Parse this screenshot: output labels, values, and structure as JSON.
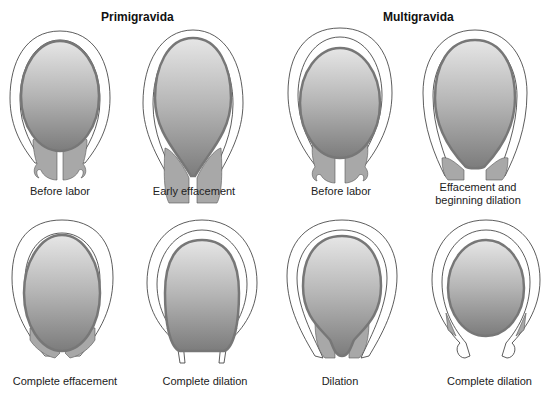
{
  "groups": [
    {
      "title": "Primigravida"
    },
    {
      "title": "Multigravida"
    }
  ],
  "panels": [
    {
      "caption": "Before labor",
      "group": "Primigravida"
    },
    {
      "caption": "Early effacement",
      "group": "Primigravida"
    },
    {
      "caption": "Before labor",
      "group": "Multigravida"
    },
    {
      "caption_line1": "Effacement and",
      "caption_line2": "beginning dilation",
      "group": "Multigravida"
    },
    {
      "caption": "Complete effacement",
      "group": "Primigravida"
    },
    {
      "caption": "Complete dilation",
      "group": "Primigravida"
    },
    {
      "caption": "Dilation",
      "group": "Multigravida"
    },
    {
      "caption": "Complete dilation",
      "group": "Multigravida"
    }
  ],
  "colors": {
    "head_top": "#e2e2e2",
    "head_bottom": "#7a7a7a",
    "head_outline": "#777777",
    "cervix": "#a8a8a8",
    "uterus_line": "#333333"
  }
}
